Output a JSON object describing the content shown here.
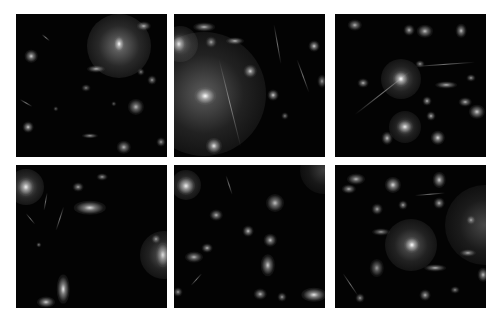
{
  "figure": {
    "layout": {
      "rows": 2,
      "cols": 3
    },
    "background_color": "#ffffff",
    "panel_color": "#030303",
    "panels": [
      {
        "id": "panel-1",
        "x": 16,
        "y": 14,
        "halos": [
          {
            "x": 103,
            "y": 32,
            "r": 32,
            "a": 0.55
          }
        ],
        "sources": [
          {
            "x": 103,
            "y": 30,
            "w": 6,
            "h": 9,
            "a": 1.0
          },
          {
            "x": 128,
            "y": 12,
            "w": 8,
            "h": 5,
            "a": 0.7
          },
          {
            "x": 15,
            "y": 42,
            "w": 7,
            "h": 7,
            "a": 0.8
          },
          {
            "x": 80,
            "y": 55,
            "w": 10,
            "h": 4,
            "a": 0.7
          },
          {
            "x": 120,
            "y": 93,
            "w": 9,
            "h": 9,
            "a": 0.7
          },
          {
            "x": 12,
            "y": 113,
            "w": 6,
            "h": 6,
            "a": 0.8
          },
          {
            "x": 74,
            "y": 122,
            "w": 9,
            "h": 3,
            "a": 0.6
          },
          {
            "x": 108,
            "y": 133,
            "w": 8,
            "h": 7,
            "a": 0.7
          },
          {
            "x": 136,
            "y": 66,
            "w": 5,
            "h": 5,
            "a": 0.6
          },
          {
            "x": 125,
            "y": 58,
            "w": 4,
            "h": 4,
            "a": 0.5
          },
          {
            "x": 70,
            "y": 74,
            "w": 5,
            "h": 4,
            "a": 0.5
          },
          {
            "x": 145,
            "y": 128,
            "w": 5,
            "h": 5,
            "a": 0.6
          },
          {
            "x": 98,
            "y": 90,
            "w": 3,
            "h": 3,
            "a": 0.4
          },
          {
            "x": 40,
            "y": 95,
            "w": 3,
            "h": 3,
            "a": 0.4
          }
        ],
        "streaks": [
          {
            "x": 4,
            "y": 85,
            "len": 14,
            "angle": 30
          },
          {
            "x": 26,
            "y": 20,
            "len": 10,
            "angle": 40
          }
        ]
      },
      {
        "id": "panel-2",
        "x": 174,
        "y": 14,
        "halos": [
          {
            "x": 30,
            "y": 80,
            "r": 62,
            "a": 0.45
          },
          {
            "x": 6,
            "y": 30,
            "r": 18,
            "a": 0.45
          }
        ],
        "sources": [
          {
            "x": 31,
            "y": 82,
            "w": 12,
            "h": 10,
            "a": 1.0
          },
          {
            "x": 5,
            "y": 30,
            "w": 8,
            "h": 10,
            "a": 0.85
          },
          {
            "x": 30,
            "y": 13,
            "w": 12,
            "h": 5,
            "a": 0.7
          },
          {
            "x": 61,
            "y": 27,
            "w": 10,
            "h": 4,
            "a": 0.7
          },
          {
            "x": 37,
            "y": 28,
            "w": 6,
            "h": 6,
            "a": 0.6
          },
          {
            "x": 76,
            "y": 57,
            "w": 7,
            "h": 7,
            "a": 0.8
          },
          {
            "x": 99,
            "y": 81,
            "w": 6,
            "h": 6,
            "a": 0.8
          },
          {
            "x": 140,
            "y": 32,
            "w": 6,
            "h": 6,
            "a": 0.8
          },
          {
            "x": 40,
            "y": 132,
            "w": 9,
            "h": 9,
            "a": 0.9
          },
          {
            "x": 111,
            "y": 102,
            "w": 4,
            "h": 4,
            "a": 0.5
          },
          {
            "x": 148,
            "y": 67,
            "w": 5,
            "h": 7,
            "a": 0.6
          }
        ],
        "streaks": [
          {
            "x": 100,
            "y": 10,
            "len": 40,
            "angle": 80
          },
          {
            "x": 123,
            "y": 45,
            "len": 35,
            "angle": 70
          },
          {
            "x": 45,
            "y": 45,
            "len": 90,
            "angle": 76
          }
        ]
      },
      {
        "id": "panel-3",
        "x": 335,
        "y": 14,
        "halos": [
          {
            "x": 66,
            "y": 65,
            "r": 20,
            "a": 0.45
          },
          {
            "x": 70,
            "y": 113,
            "r": 16,
            "a": 0.4
          }
        ],
        "sources": [
          {
            "x": 66,
            "y": 65,
            "w": 9,
            "h": 9,
            "a": 1.0
          },
          {
            "x": 70,
            "y": 113,
            "w": 9,
            "h": 8,
            "a": 0.9
          },
          {
            "x": 20,
            "y": 11,
            "w": 8,
            "h": 6,
            "a": 0.7
          },
          {
            "x": 74,
            "y": 16,
            "w": 6,
            "h": 6,
            "a": 0.7
          },
          {
            "x": 90,
            "y": 17,
            "w": 9,
            "h": 7,
            "a": 0.75
          },
          {
            "x": 126,
            "y": 17,
            "w": 6,
            "h": 8,
            "a": 0.75
          },
          {
            "x": 111,
            "y": 71,
            "w": 12,
            "h": 4,
            "a": 0.7
          },
          {
            "x": 130,
            "y": 88,
            "w": 7,
            "h": 5,
            "a": 0.7
          },
          {
            "x": 142,
            "y": 98,
            "w": 9,
            "h": 8,
            "a": 0.8
          },
          {
            "x": 28,
            "y": 69,
            "w": 6,
            "h": 5,
            "a": 0.7
          },
          {
            "x": 92,
            "y": 87,
            "w": 5,
            "h": 5,
            "a": 0.7
          },
          {
            "x": 96,
            "y": 102,
            "w": 5,
            "h": 5,
            "a": 0.7
          },
          {
            "x": 52,
            "y": 124,
            "w": 6,
            "h": 7,
            "a": 0.75
          },
          {
            "x": 103,
            "y": 124,
            "w": 8,
            "h": 8,
            "a": 0.85
          },
          {
            "x": 85,
            "y": 50,
            "w": 5,
            "h": 4,
            "a": 0.6
          },
          {
            "x": 136,
            "y": 64,
            "w": 5,
            "h": 4,
            "a": 0.6
          }
        ],
        "streaks": [
          {
            "x": 20,
            "y": 100,
            "len": 70,
            "angle": -38
          },
          {
            "x": 80,
            "y": 52,
            "len": 60,
            "angle": -4
          }
        ]
      },
      {
        "id": "panel-4",
        "x": 16,
        "y": 165,
        "halos": [
          {
            "x": 10,
            "y": 22,
            "r": 18,
            "a": 0.5
          },
          {
            "x": 148,
            "y": 90,
            "r": 24,
            "a": 0.45
          }
        ],
        "sources": [
          {
            "x": 10,
            "y": 22,
            "w": 9,
            "h": 10,
            "a": 0.9
          },
          {
            "x": 147,
            "y": 90,
            "w": 8,
            "h": 14,
            "a": 0.8
          },
          {
            "x": 74,
            "y": 43,
            "w": 18,
            "h": 8,
            "a": 0.85
          },
          {
            "x": 62,
            "y": 22,
            "w": 6,
            "h": 5,
            "a": 0.65
          },
          {
            "x": 86,
            "y": 12,
            "w": 6,
            "h": 4,
            "a": 0.6
          },
          {
            "x": 47,
            "y": 124,
            "w": 7,
            "h": 16,
            "a": 0.9
          },
          {
            "x": 30,
            "y": 137,
            "w": 10,
            "h": 6,
            "a": 0.8
          },
          {
            "x": 140,
            "y": 74,
            "w": 5,
            "h": 5,
            "a": 0.6
          },
          {
            "x": 23,
            "y": 80,
            "w": 3,
            "h": 3,
            "a": 0.5
          }
        ],
        "streaks": [
          {
            "x": 40,
            "y": 65,
            "len": 25,
            "angle": -72
          },
          {
            "x": 28,
            "y": 45,
            "len": 18,
            "angle": -80
          },
          {
            "x": 10,
            "y": 48,
            "len": 14,
            "angle": 50
          }
        ]
      },
      {
        "id": "panel-5",
        "x": 174,
        "y": 165,
        "halos": [
          {
            "x": 12,
            "y": 20,
            "r": 15,
            "a": 0.45
          },
          {
            "x": 150,
            "y": 5,
            "r": 24,
            "a": 0.3
          }
        ],
        "sources": [
          {
            "x": 12,
            "y": 21,
            "w": 10,
            "h": 10,
            "a": 0.9
          },
          {
            "x": 101,
            "y": 38,
            "w": 10,
            "h": 10,
            "a": 0.75
          },
          {
            "x": 42,
            "y": 50,
            "w": 7,
            "h": 6,
            "a": 0.7
          },
          {
            "x": 74,
            "y": 66,
            "w": 6,
            "h": 6,
            "a": 0.75
          },
          {
            "x": 96,
            "y": 75,
            "w": 7,
            "h": 7,
            "a": 0.75
          },
          {
            "x": 33,
            "y": 83,
            "w": 6,
            "h": 5,
            "a": 0.7
          },
          {
            "x": 20,
            "y": 92,
            "w": 10,
            "h": 6,
            "a": 0.7
          },
          {
            "x": 94,
            "y": 100,
            "w": 8,
            "h": 12,
            "a": 0.8
          },
          {
            "x": 86,
            "y": 129,
            "w": 7,
            "h": 6,
            "a": 0.7
          },
          {
            "x": 140,
            "y": 130,
            "w": 14,
            "h": 8,
            "a": 0.9
          },
          {
            "x": 108,
            "y": 132,
            "w": 5,
            "h": 5,
            "a": 0.6
          },
          {
            "x": 4,
            "y": 127,
            "w": 5,
            "h": 5,
            "a": 0.6
          }
        ],
        "streaks": [
          {
            "x": 17,
            "y": 120,
            "len": 16,
            "angle": -48
          },
          {
            "x": 52,
            "y": 10,
            "len": 20,
            "angle": 72
          }
        ]
      },
      {
        "id": "panel-6",
        "x": 335,
        "y": 165,
        "halos": [
          {
            "x": 76,
            "y": 80,
            "r": 26,
            "a": 0.45
          },
          {
            "x": 150,
            "y": 60,
            "r": 40,
            "a": 0.35
          }
        ],
        "sources": [
          {
            "x": 77,
            "y": 80,
            "w": 9,
            "h": 9,
            "a": 1.0
          },
          {
            "x": 58,
            "y": 20,
            "w": 9,
            "h": 9,
            "a": 0.85
          },
          {
            "x": 104,
            "y": 15,
            "w": 7,
            "h": 9,
            "a": 0.8
          },
          {
            "x": 21,
            "y": 14,
            "w": 10,
            "h": 6,
            "a": 0.7
          },
          {
            "x": 14,
            "y": 24,
            "w": 8,
            "h": 5,
            "a": 0.7
          },
          {
            "x": 104,
            "y": 38,
            "w": 6,
            "h": 6,
            "a": 0.7
          },
          {
            "x": 68,
            "y": 40,
            "w": 5,
            "h": 5,
            "a": 0.65
          },
          {
            "x": 42,
            "y": 44,
            "w": 6,
            "h": 6,
            "a": 0.65
          },
          {
            "x": 42,
            "y": 103,
            "w": 8,
            "h": 10,
            "a": 0.6
          },
          {
            "x": 46,
            "y": 67,
            "w": 10,
            "h": 4,
            "a": 0.6
          },
          {
            "x": 100,
            "y": 103,
            "w": 12,
            "h": 4,
            "a": 0.7
          },
          {
            "x": 133,
            "y": 88,
            "w": 9,
            "h": 4,
            "a": 0.65
          },
          {
            "x": 148,
            "y": 110,
            "w": 6,
            "h": 8,
            "a": 0.75
          },
          {
            "x": 136,
            "y": 55,
            "w": 5,
            "h": 5,
            "a": 0.6
          },
          {
            "x": 90,
            "y": 130,
            "w": 6,
            "h": 6,
            "a": 0.7
          },
          {
            "x": 25,
            "y": 133,
            "w": 5,
            "h": 5,
            "a": 0.6
          },
          {
            "x": 120,
            "y": 125,
            "w": 5,
            "h": 4,
            "a": 0.55
          }
        ],
        "streaks": [
          {
            "x": 8,
            "y": 108,
            "len": 26,
            "angle": 56
          },
          {
            "x": 80,
            "y": 30,
            "len": 30,
            "angle": -5
          }
        ]
      }
    ]
  }
}
